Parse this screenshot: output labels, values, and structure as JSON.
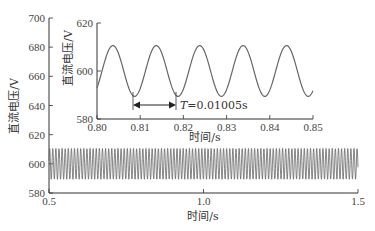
{
  "chart_data": [
    {
      "type": "line",
      "role": "main",
      "title": "",
      "xlabel": "时间/s",
      "ylabel": "直流电压/V",
      "xlim": [
        0.5,
        1.5
      ],
      "ylim": [
        580,
        700
      ],
      "xticks": [
        "0.5",
        "1.0",
        "1.5"
      ],
      "yticks": [
        "580",
        "600",
        "620",
        "640",
        "660",
        "680",
        "700"
      ],
      "grid": false,
      "series": [
        {
          "name": "DC voltage",
          "mean": 600,
          "amplitude": 10.6,
          "period_s": 0.01005,
          "x_range": [
            0.5,
            1.5
          ]
        }
      ]
    },
    {
      "type": "line",
      "role": "inset",
      "title": "",
      "xlabel": "时间/s",
      "ylabel": "直流电压/V",
      "xlim": [
        0.8,
        0.85
      ],
      "ylim": [
        580,
        620
      ],
      "xticks": [
        "0.80",
        "0.81",
        "0.82",
        "0.83",
        "0.84",
        "0.85"
      ],
      "yticks": [
        "580",
        "600",
        "620"
      ],
      "grid": false,
      "series": [
        {
          "name": "DC voltage",
          "mean": 600,
          "amplitude": 10.6,
          "period_s": 0.01005,
          "x_range": [
            0.8,
            0.85
          ],
          "peaks_x": [
            0.8037,
            0.8137,
            0.8238,
            0.8338,
            0.8439
          ],
          "troughs_x": [
            0.8087,
            0.8188,
            0.8288,
            0.8389,
            0.8489
          ]
        }
      ],
      "annotations": [
        {
          "type": "double-arrow",
          "from_x": 0.8087,
          "to_x": 0.8188,
          "y": 586.5,
          "text": "T=0.01005s"
        }
      ]
    }
  ],
  "labels": {
    "main_ylabel": "直流电压/V",
    "main_xlabel": "时间/s",
    "inset_ylabel": "直流电压/V",
    "inset_xlabel": "时间/s",
    "period_annotation_T": "T",
    "period_annotation_value": "=0.01005s"
  },
  "colors": {
    "line": "#555555",
    "axis": "#333333"
  }
}
